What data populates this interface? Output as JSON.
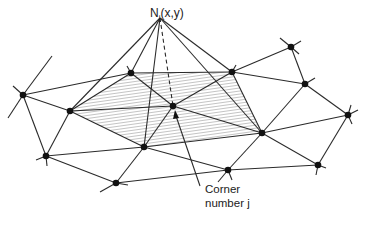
{
  "diagram": {
    "title_label": "Nj(x,y)",
    "apex_label_base": "N",
    "apex_label_sub": "j",
    "apex_label_args": "(x,y)",
    "corner_label_line1": "Corner",
    "corner_label_line2": "number j",
    "colors": {
      "line": "#2a2a2a",
      "node": "#111111",
      "hatch": "#555555",
      "background": "#ffffff"
    },
    "apex": [
      160,
      18
    ],
    "center_node": [
      173,
      106
    ],
    "nodes": [
      [
        23,
        95
      ],
      [
        131,
        73
      ],
      [
        232,
        72
      ],
      [
        291,
        47
      ],
      [
        305,
        84
      ],
      [
        348,
        115
      ],
      [
        70,
        111
      ],
      [
        173,
        106
      ],
      [
        262,
        133
      ],
      [
        46,
        156
      ],
      [
        144,
        147
      ],
      [
        228,
        170
      ],
      [
        318,
        165
      ],
      [
        116,
        183
      ]
    ],
    "shaded_patch": [
      [
        131,
        73
      ],
      [
        232,
        72
      ],
      [
        262,
        133
      ],
      [
        144,
        147
      ],
      [
        70,
        111
      ]
    ]
  }
}
